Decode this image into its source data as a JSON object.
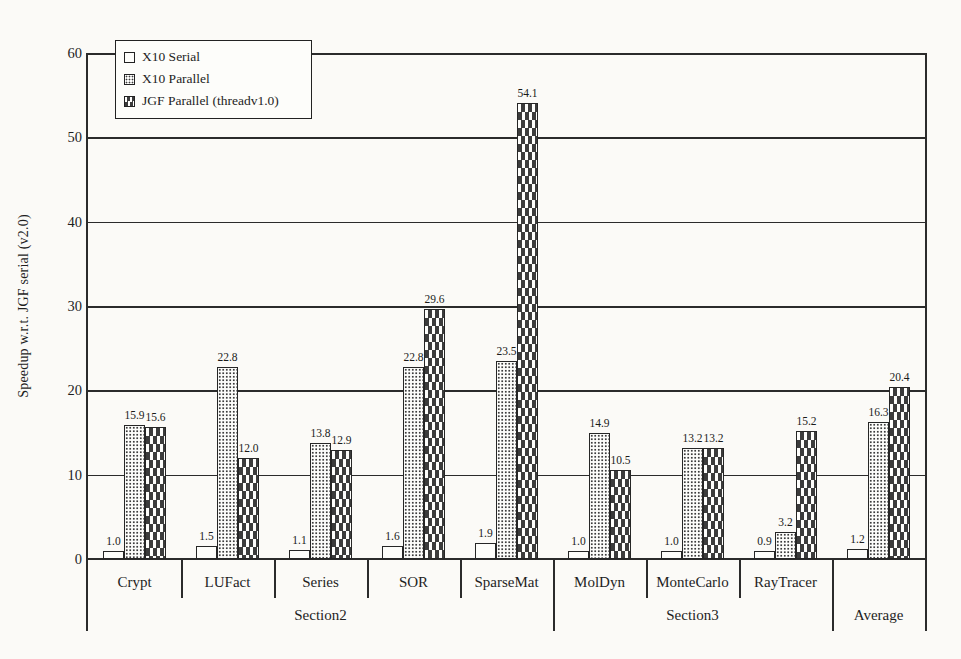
{
  "figure": {
    "background": "#fbfaf7",
    "ink": "#2b2b2b",
    "bar_fill": "#fdfdfa"
  },
  "chart_data": {
    "type": "bar",
    "title": "",
    "xlabel": "",
    "ylabel": "Speedup w.r.t. JGF serial (v2.0)",
    "ylim": [
      0,
      60
    ],
    "yticks": [
      0,
      10,
      20,
      30,
      40,
      50,
      60
    ],
    "grid": true,
    "legend_position": "top-left",
    "categories": [
      "Crypt",
      "LUFact",
      "Series",
      "SOR",
      "SparseMat",
      "MolDyn",
      "MonteCarlo",
      "RayTracer",
      "Average"
    ],
    "sections": [
      {
        "label": "Section2",
        "start": 0,
        "end": 4
      },
      {
        "label": "Section3",
        "start": 5,
        "end": 7
      },
      {
        "label": "Average",
        "start": 8,
        "end": 8
      }
    ],
    "series": [
      {
        "name": "X10 Serial",
        "pattern": "plain",
        "values": [
          1.0,
          1.5,
          1.1,
          1.6,
          1.9,
          1.0,
          1.0,
          0.9,
          1.2
        ]
      },
      {
        "name": "X10 Parallel",
        "pattern": "dots",
        "values": [
          15.9,
          22.8,
          13.8,
          22.8,
          23.5,
          14.9,
          13.2,
          3.2,
          16.3
        ]
      },
      {
        "name": "JGF Parallel (threadv1.0)",
        "pattern": "dashes",
        "values": [
          15.6,
          12.0,
          12.9,
          29.6,
          54.1,
          10.5,
          13.2,
          15.2,
          20.4
        ]
      }
    ]
  }
}
